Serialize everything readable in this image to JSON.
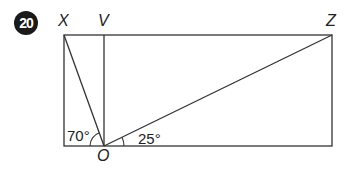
{
  "question_number": "20",
  "points": {
    "X": "X",
    "V": "V",
    "Z": "Z",
    "O": "O"
  },
  "angles": {
    "angle_XOleft": "70°",
    "angle_ZOright": "25°"
  },
  "colors": {
    "line": "#333333",
    "badge": "#1a1a1a"
  }
}
